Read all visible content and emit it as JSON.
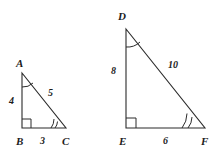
{
  "figure": {
    "stroke_color": "#2b2b2b",
    "background": "#ffffff",
    "triangles": [
      {
        "name": "triangle-abc",
        "vertices": {
          "A": {
            "label": "A",
            "x": 22,
            "y": 73
          },
          "B": {
            "label": "B",
            "x": 22,
            "y": 128
          },
          "C": {
            "label": "C",
            "x": 66,
            "y": 128
          }
        },
        "sides": {
          "AB": {
            "label": "4"
          },
          "BC": {
            "label": "3"
          },
          "AC": {
            "label": "5"
          }
        },
        "marks": {
          "right_angle_at": "B",
          "single_arc_at": "A",
          "double_arc_at": "C"
        }
      },
      {
        "name": "triangle-def",
        "vertices": {
          "D": {
            "label": "D",
            "x": 126,
            "y": 29
          },
          "E": {
            "label": "E",
            "x": 126,
            "y": 128
          },
          "F": {
            "label": "F",
            "x": 205,
            "y": 128
          }
        },
        "sides": {
          "DE": {
            "label": "8"
          },
          "EF": {
            "label": "6"
          },
          "DF": {
            "label": "10"
          }
        },
        "marks": {
          "right_angle_at": "E",
          "single_arc_at": "D",
          "double_arc_at": "F"
        }
      }
    ],
    "labels": [
      {
        "name": "vertex-label-a",
        "text": "A",
        "x": 16,
        "y": 58,
        "kind": "vertex"
      },
      {
        "name": "vertex-label-b",
        "text": "B",
        "x": 16,
        "y": 136,
        "kind": "vertex"
      },
      {
        "name": "vertex-label-c",
        "text": "C",
        "x": 62,
        "y": 136,
        "kind": "vertex"
      },
      {
        "name": "side-label-ab",
        "text": "4",
        "x": 9,
        "y": 96,
        "kind": "length"
      },
      {
        "name": "side-label-bc",
        "text": "3",
        "x": 40,
        "y": 136,
        "kind": "length"
      },
      {
        "name": "side-label-ac",
        "text": "5",
        "x": 48,
        "y": 88,
        "kind": "length"
      },
      {
        "name": "vertex-label-d",
        "text": "D",
        "x": 118,
        "y": 11,
        "kind": "vertex"
      },
      {
        "name": "vertex-label-e",
        "text": "E",
        "x": 119,
        "y": 136,
        "kind": "vertex"
      },
      {
        "name": "vertex-label-f",
        "text": "F",
        "x": 201,
        "y": 136,
        "kind": "vertex"
      },
      {
        "name": "side-label-de",
        "text": "8",
        "x": 111,
        "y": 66,
        "kind": "length"
      },
      {
        "name": "side-label-ef",
        "text": "6",
        "x": 163,
        "y": 136,
        "kind": "length"
      },
      {
        "name": "side-label-df",
        "text": "10",
        "x": 168,
        "y": 60,
        "kind": "length"
      }
    ]
  }
}
